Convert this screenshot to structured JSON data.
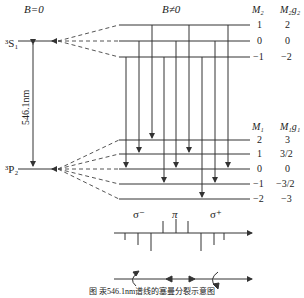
{
  "header": {
    "left_title": "B=0",
    "right_title": "B≠0",
    "upper_col1": "M₂",
    "upper_col2": "M₂g₂",
    "lower_col1": "M₁",
    "lower_col2": "M₁g₁"
  },
  "levels": {
    "upper_state": "³S₁",
    "lower_state": "³P₂",
    "wavelength": "546.1nm"
  },
  "upper_sublevels": [
    {
      "M": "1",
      "Mg": "2"
    },
    {
      "M": "0",
      "Mg": "0"
    },
    {
      "M": "−1",
      "Mg": "−2"
    }
  ],
  "lower_sublevels": [
    {
      "M": "2",
      "Mg": "3"
    },
    {
      "M": "1",
      "Mg": "3/2"
    },
    {
      "M": "0",
      "Mg": "0"
    },
    {
      "M": "−1",
      "Mg": "−3/2"
    },
    {
      "M": "−2",
      "Mg": "−3"
    }
  ],
  "polarization_labels": {
    "sigma_minus": "σ⁻",
    "pi": "π",
    "sigma_plus": "σ⁺"
  },
  "caption": "图 汞546.1nm谱线的塞曼分裂示意图",
  "colors": {
    "line": "#333333",
    "text": "#222222",
    "background": "#ffffff"
  }
}
